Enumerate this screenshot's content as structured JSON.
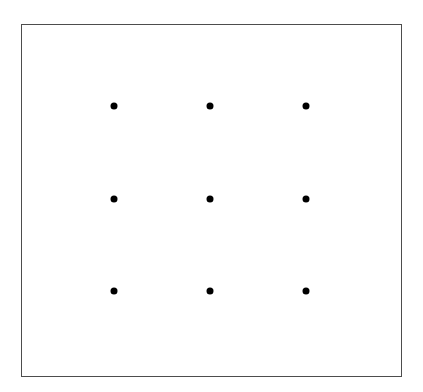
{
  "figure": {
    "name": "nine-dots-puzzle",
    "background_color": "#ffffff",
    "frame": {
      "border_color": "#4d4d4d",
      "border_width_px": 1,
      "fill_color": "#ffffff",
      "x": 21,
      "y": 24,
      "width": 381,
      "height": 353
    },
    "dot_style": {
      "color": "#000000",
      "diameter_px": 7,
      "shape": "circle"
    },
    "grid": {
      "rows": 3,
      "columns": 3,
      "column_x": [
        92,
        188,
        284
      ],
      "row_y": [
        81,
        174,
        266
      ],
      "column_spacing_px": 96,
      "row_spacing_px": 93
    },
    "dots": [
      {
        "id": "dot-r1-c1",
        "label": "top-left",
        "row": 1,
        "col": 1,
        "x": 92,
        "y": 81
      },
      {
        "id": "dot-r1-c2",
        "label": "top-center",
        "row": 1,
        "col": 2,
        "x": 188,
        "y": 81
      },
      {
        "id": "dot-r1-c3",
        "label": "top-right",
        "row": 1,
        "col": 3,
        "x": 284,
        "y": 81
      },
      {
        "id": "dot-r2-c1",
        "label": "middle-left",
        "row": 2,
        "col": 1,
        "x": 92,
        "y": 174
      },
      {
        "id": "dot-r2-c2",
        "label": "middle-center",
        "row": 2,
        "col": 2,
        "x": 188,
        "y": 174
      },
      {
        "id": "dot-r2-c3",
        "label": "middle-right",
        "row": 2,
        "col": 3,
        "x": 284,
        "y": 174
      },
      {
        "id": "dot-r3-c1",
        "label": "bottom-left",
        "row": 3,
        "col": 1,
        "x": 92,
        "y": 266
      },
      {
        "id": "dot-r3-c2",
        "label": "bottom-center",
        "row": 3,
        "col": 2,
        "x": 188,
        "y": 266
      },
      {
        "id": "dot-r3-c3",
        "label": "bottom-right",
        "row": 3,
        "col": 3,
        "x": 284,
        "y": 266
      }
    ]
  }
}
